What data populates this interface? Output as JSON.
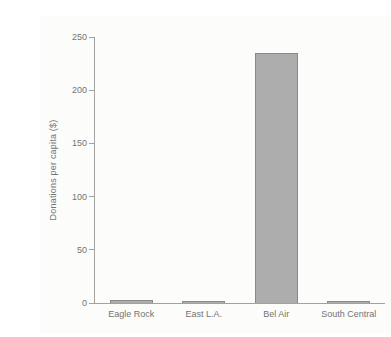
{
  "chart_data": {
    "type": "bar",
    "title": "",
    "categories": [
      "Eagle Rock",
      "East L.A.",
      "Bel Air",
      "South Central"
    ],
    "values": [
      3,
      1,
      235,
      1
    ],
    "xlabel": "",
    "ylabel": "Donations per capita ($)",
    "ylim": [
      0,
      250
    ],
    "yticks": [
      0,
      50,
      100,
      150,
      200,
      250
    ],
    "grid": false,
    "legend": "none",
    "colors": {
      "bar_fill": "#adadad",
      "bar_border": "#8a8a8a",
      "axis": "#a2a2a2",
      "text": "#737373",
      "background": "#fcfcfb"
    }
  }
}
